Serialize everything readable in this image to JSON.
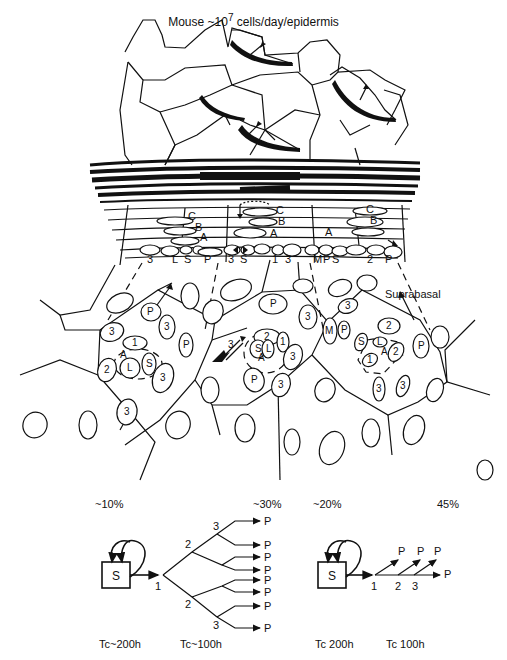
{
  "title": {
    "text": "Mouse ~10",
    "exponent": "7",
    "suffix": " cells/day/epidermis"
  },
  "tissue": {
    "suprabasal_label": "Suprabasal",
    "layer_letters": [
      "C",
      "B",
      "A"
    ],
    "basal_row_labels": [
      "3",
      "L",
      "S",
      "P",
      "3",
      "S",
      "1",
      "3",
      "M",
      "P",
      "S",
      "2",
      "P"
    ],
    "cell_labels": {
      "left_unit": [
        "P",
        "3",
        "1",
        "A",
        "L",
        "S",
        "2",
        "3",
        "P",
        "3",
        "3"
      ],
      "center_unit": [
        "P",
        "3",
        "2",
        "S",
        "L",
        "1",
        "A",
        "3",
        "P",
        "3"
      ],
      "right_unit": [
        "M",
        "P",
        "3",
        "S",
        "2",
        "L",
        "A",
        "1",
        "2",
        "P",
        "3",
        "3"
      ]
    }
  },
  "schemes": [
    {
      "name": "branching-lineage",
      "pct_stem": "~10%",
      "pct_progeny": "~30%",
      "stem_label": "S",
      "generations": [
        "1",
        "2",
        "2",
        "3",
        "3"
      ],
      "progeny_label": "P",
      "progeny_count": 8,
      "tc_stem": "Tc~200h",
      "tc_progeny": "Tc~100h"
    },
    {
      "name": "linear-lineage",
      "pct_stem": "~20%",
      "pct_progeny": "45%",
      "stem_label": "S",
      "generations": [
        "1",
        "2",
        "3"
      ],
      "progeny_label": "P",
      "progeny_count": 4,
      "tc_stem": "Tc 200h",
      "tc_progeny": "Tc 100h"
    }
  ]
}
